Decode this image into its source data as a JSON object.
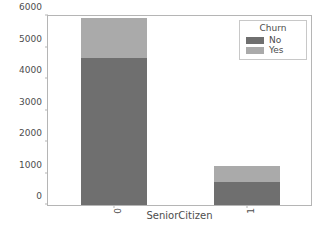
{
  "chart_data": {
    "type": "bar",
    "barmode": "stacked",
    "title": "",
    "xlabel": "SeniorCitizen",
    "ylabel": "",
    "categories": [
      "0",
      "1"
    ],
    "series": [
      {
        "name": "No",
        "values": [
          4654,
          746
        ],
        "color": "#6f6f6f"
      },
      {
        "name": "Yes",
        "values": [
          1280,
          486
        ],
        "color": "#aaaaaa"
      }
    ],
    "totals": [
      5934,
      1232
    ],
    "ylim": [
      0,
      6000
    ],
    "yticks": [
      0,
      1000,
      2000,
      3000,
      4000,
      5000,
      6000
    ],
    "ytick_labels": [
      "0",
      "1000",
      "2000",
      "3000",
      "4000",
      "5000",
      "6000"
    ],
    "xtick_labels": [
      "0",
      "1"
    ],
    "xtick_rotation": -90,
    "grid": false,
    "legend": {
      "title": "Churn",
      "position": "upper right",
      "entries": [
        {
          "label": "No",
          "color": "#6f6f6f"
        },
        {
          "label": "Yes",
          "color": "#aaaaaa"
        }
      ]
    },
    "axis_color": "#b5b5b5",
    "text_color": "#4d4d4d",
    "background": "#ffffff"
  }
}
